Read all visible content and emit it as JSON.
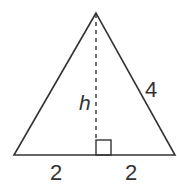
{
  "diagram": {
    "type": "isosceles-triangle-height",
    "labels": {
      "height": "h",
      "side": "4",
      "base_left": "2",
      "base_right": "2"
    },
    "colors": {
      "stroke": "#333333",
      "background": "#ffffff"
    }
  }
}
